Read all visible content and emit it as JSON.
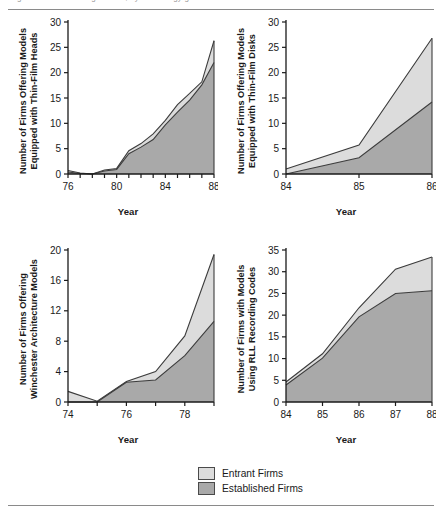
{
  "figure": {
    "cropped_header_text": "Figure — firms offering models, by technology generation",
    "background": "#ffffff",
    "rule_color": "#8a8a8a"
  },
  "colors": {
    "entrant_fill": "#dcdcdc",
    "established_fill": "#a9a9a9",
    "line": "#3c3c3c",
    "axis": "#1a1a1a",
    "text": "#1a1a1a"
  },
  "legend": {
    "position": "bottom-center",
    "items": [
      {
        "label": "Entrant Firms",
        "color": "#dcdcdc"
      },
      {
        "label": "Established Firms",
        "color": "#a9a9a9"
      }
    ]
  },
  "chart_data": [
    {
      "id": "thin-film-heads",
      "type": "area",
      "stacked": true,
      "title": "",
      "ylabel_line1": "Number of Firms Offering Models",
      "ylabel_line2": "Equipped with Thin-Film Heads",
      "xlabel": "Year",
      "x": [
        76,
        77,
        78,
        79,
        80,
        81,
        82,
        83,
        84,
        85,
        86,
        87,
        88
      ],
      "xticks": [
        76,
        77,
        78,
        79,
        80,
        81,
        82,
        83,
        84,
        85,
        86,
        87,
        88
      ],
      "xticklabels": [
        "76",
        "",
        "",
        "",
        "80",
        "",
        "",
        "",
        "84",
        "",
        "",
        "",
        "88"
      ],
      "xlim": [
        76,
        88
      ],
      "ylim": [
        0,
        30
      ],
      "yticks": [
        0,
        5,
        10,
        15,
        20,
        25,
        30
      ],
      "yticklabels": [
        "0",
        "5",
        "10",
        "15",
        "20",
        "25",
        "30"
      ],
      "grid": false,
      "series": [
        {
          "name": "Established Firms",
          "values": [
            0.4,
            0.1,
            0.0,
            0.6,
            0.9,
            4.0,
            5.3,
            6.8,
            9.7,
            12.2,
            14.6,
            17.6,
            22.0
          ]
        },
        {
          "name": "Entrant Firms",
          "values": [
            0.3,
            0.1,
            0.0,
            0.2,
            0.2,
            0.6,
            0.7,
            1.1,
            0.9,
            1.5,
            1.3,
            0.6,
            4.3
          ]
        }
      ],
      "totals": [
        0.7,
        0.2,
        0.0,
        0.8,
        1.1,
        4.6,
        6.0,
        7.9,
        10.6,
        13.7,
        15.9,
        18.2,
        26.3
      ]
    },
    {
      "id": "thin-film-disks",
      "type": "area",
      "stacked": true,
      "title": "",
      "ylabel_line1": "Number of Firms Offering Models",
      "ylabel_line2": "Equipped with Thin-Film Disks",
      "xlabel": "Year",
      "x": [
        84,
        85,
        86
      ],
      "xticks": [
        84,
        85,
        86
      ],
      "xticklabels": [
        "84",
        "85",
        "86"
      ],
      "xlim": [
        84,
        86
      ],
      "ylim": [
        0,
        30
      ],
      "yticks": [
        0,
        5,
        10,
        15,
        20,
        25,
        30
      ],
      "yticklabels": [
        "0",
        "5",
        "10",
        "15",
        "20",
        "25",
        "30"
      ],
      "grid": false,
      "series": [
        {
          "name": "Established Firms",
          "values": [
            0.0,
            3.2,
            14.2
          ]
        },
        {
          "name": "Entrant Firms",
          "values": [
            1.0,
            2.5,
            12.6
          ]
        }
      ],
      "totals": [
        1.0,
        5.7,
        26.8
      ]
    },
    {
      "id": "winchester-architecture",
      "type": "area",
      "stacked": true,
      "title": "",
      "ylabel_line1": "Number of Firms Offering",
      "ylabel_line2": "Winchester Architecture Models",
      "xlabel": "Year",
      "x": [
        74,
        75,
        76,
        77,
        78,
        79
      ],
      "xticks": [
        74,
        75,
        76,
        77,
        78,
        79
      ],
      "xticklabels": [
        "74",
        "",
        "76",
        "",
        "78",
        ""
      ],
      "xlim": [
        74,
        79
      ],
      "ylim": [
        0,
        20
      ],
      "yticks": [
        0,
        4,
        8,
        12,
        16,
        20
      ],
      "yticklabels": [
        "0",
        "4",
        "8",
        "12",
        "16",
        "20"
      ],
      "grid": false,
      "series": [
        {
          "name": "Established Firms",
          "values": [
            0.0,
            0.0,
            2.6,
            2.9,
            6.1,
            10.6
          ]
        },
        {
          "name": "Entrant Firms",
          "values": [
            1.4,
            0.1,
            0.1,
            1.1,
            2.6,
            8.8
          ]
        }
      ],
      "totals": [
        1.4,
        0.1,
        2.7,
        4.0,
        8.7,
        19.4
      ]
    },
    {
      "id": "rll-recording-codes",
      "type": "area",
      "stacked": true,
      "title": "",
      "ylabel_line1": "Number of Firms with Models",
      "ylabel_line2": "Using RLL Recording Codes",
      "xlabel": "Year",
      "x": [
        84,
        85,
        86,
        87,
        88
      ],
      "xticks": [
        84,
        85,
        86,
        87,
        88
      ],
      "xticklabels": [
        "84",
        "85",
        "86",
        "87",
        "88"
      ],
      "xlim": [
        84,
        88
      ],
      "ylim": [
        0,
        35
      ],
      "yticks": [
        0,
        5,
        10,
        15,
        20,
        25,
        30,
        35
      ],
      "yticklabels": [
        "0",
        "5",
        "10",
        "15",
        "20",
        "25",
        "30",
        "35"
      ],
      "grid": false,
      "series": [
        {
          "name": "Established Firms",
          "values": [
            3.9,
            10.1,
            19.6,
            25.0,
            25.6
          ]
        },
        {
          "name": "Entrant Firms",
          "values": [
            0.7,
            1.0,
            2.1,
            5.6,
            7.8
          ]
        }
      ],
      "totals": [
        4.6,
        11.1,
        21.7,
        30.6,
        33.4
      ]
    }
  ]
}
